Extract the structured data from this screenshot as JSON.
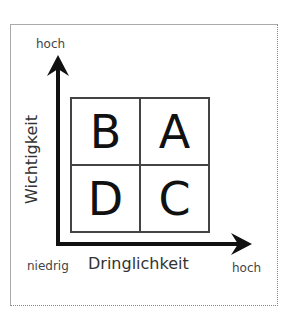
{
  "diagram": {
    "type": "eisenhower-matrix",
    "y_axis": {
      "label": "Wichtigkeit",
      "high": "hoch"
    },
    "x_axis": {
      "label": "Dringlichkeit",
      "low": "niedrig",
      "high": "hoch"
    },
    "quadrants": [
      {
        "position": "top-left",
        "label": "B"
      },
      {
        "position": "top-right",
        "label": "A"
      },
      {
        "position": "bottom-left",
        "label": "D"
      },
      {
        "position": "bottom-right",
        "label": "C"
      }
    ]
  }
}
